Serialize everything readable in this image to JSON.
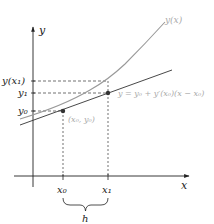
{
  "diagram": {
    "axes": {
      "x_label": "x",
      "y_label": "y"
    },
    "ticks": {
      "x0": "x₀",
      "x1": "x₁",
      "y0": "y₀",
      "y1": "y₁",
      "yx1": "y(x₁)"
    },
    "labels": {
      "curve": "y(x)",
      "tangent": "y = y₀ + y′(x₀)(x − x₀)",
      "point": "(x₀, y₀)",
      "step": "h"
    },
    "colors": {
      "axis": "#222222",
      "curve": "#999999",
      "tangent": "#333333",
      "dashed": "#333333",
      "muted_text": "#aaaaaa"
    }
  }
}
